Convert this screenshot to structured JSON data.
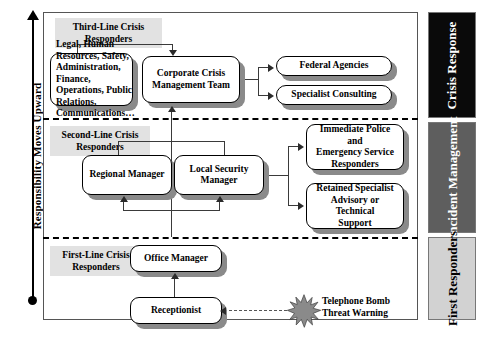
{
  "axis": {
    "label": "Responsibility Moves Upward"
  },
  "sections": [
    {
      "tag": "Third-Line Crisis\nResponders",
      "tag_line1": "Third-Line Crisis",
      "tag_line2": "Responders",
      "band_label": "Crisis Response",
      "band_bg": "#0a0a0a",
      "band_fg": "#ffffff"
    },
    {
      "tag_line1": "Second-Line Crisis",
      "tag_line2": "Responders",
      "band_label": "Incident Management",
      "band_bg": "#5e5e5e",
      "band_fg": "#ffffff"
    },
    {
      "tag_line1": "First-Line Crisis",
      "tag_line2": "Responders",
      "band_label": "First Responders",
      "band_bg": "#d2d2d2",
      "band_fg": "#000000"
    }
  ],
  "nodes": {
    "departments": "Legal, Human Resources, Safety, Administration, Finance, Operations, Public Relations, Communications…",
    "ccmt_line1": "Corporate Crisis",
    "ccmt_line2": "Management Team",
    "federal_agencies": "Federal Agencies",
    "specialist_consulting": "Specialist Consulting",
    "regional_manager": "Regional Manager",
    "local_security_line1": "Local Security",
    "local_security_line2": "Manager",
    "police_line1": "Immediate Police and",
    "police_line2": "Emergency Service",
    "police_line3": "Responders",
    "retained_line1": "Retained Specialist",
    "retained_line2": "Advisory or Technical",
    "retained_line3": "Support",
    "office_manager": "Office Manager",
    "receptionist": "Receptionist"
  },
  "event": {
    "line1": "Telephone Bomb",
    "line2": "Threat Warning"
  },
  "colors": {
    "frame": "#555555",
    "shadow": "#8a8a8a",
    "tag_bg": "#e2e2e2",
    "connector": "#3a3a3a"
  }
}
